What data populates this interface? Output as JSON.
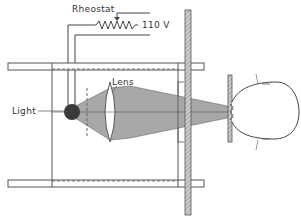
{
  "diagram": {
    "type": "optical apparatus schematic",
    "labels": {
      "rheostat": "Rheostat",
      "voltage": "110 V",
      "lens": "Lens",
      "light": "Light"
    },
    "colors": {
      "line": "#444444",
      "beam": "#a8a8a8",
      "bulb": "#3a3a3a",
      "hatch": "#8c8c8c",
      "background": "#ffffff"
    }
  }
}
